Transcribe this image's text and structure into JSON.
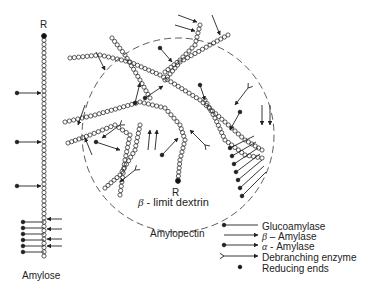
{
  "diagram": {
    "labels": {
      "amylose": "Amylose",
      "amylopectin": "Amylopectin",
      "reducing_end_left": "R",
      "reducing_end_center": "R",
      "beta_limit_symbol": "β",
      "beta_limit_text": " - limit dextrin"
    },
    "legend": [
      {
        "symbol": "glucoamylase-arrow",
        "label": "Glucoamylase"
      },
      {
        "symbol": "beta-amylase-arrow",
        "greek": "β",
        "label": " – Amylase"
      },
      {
        "symbol": "alpha-amylase-arrow",
        "greek": "α",
        "label": " - Amylase"
      },
      {
        "symbol": "debranching-arrow",
        "label": "Debranching enzyme"
      },
      {
        "symbol": "reducing-end-dot",
        "label": "Reducing ends"
      }
    ],
    "colors": {
      "line": "#222222",
      "background": "#ffffff"
    }
  }
}
